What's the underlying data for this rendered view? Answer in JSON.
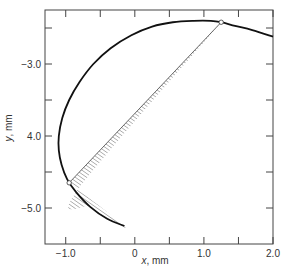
{
  "chart_data": {
    "type": "line",
    "title": "",
    "xlabel": "x, mm",
    "ylabel": "y, mm",
    "xlabel_var": "x",
    "xlabel_unit": ", mm",
    "ylabel_var": "y",
    "ylabel_unit": ", mm",
    "xlim": [
      -1.3,
      2.0
    ],
    "ylim": [
      -5.5,
      -2.25
    ],
    "grid": false,
    "x_ticks": [
      {
        "value": -1.0,
        "label": "−1.0"
      },
      {
        "value": -0.5,
        "label": ""
      },
      {
        "value": 0,
        "label": "0"
      },
      {
        "value": 0.5,
        "label": ""
      },
      {
        "value": 1.0,
        "label": "1.0"
      },
      {
        "value": 1.5,
        "label": ""
      },
      {
        "value": 2.0,
        "label": "2.0"
      }
    ],
    "y_ticks": [
      {
        "value": -2.5,
        "label": ""
      },
      {
        "value": -3.0,
        "label": "−3.0"
      },
      {
        "value": -3.5,
        "label": ""
      },
      {
        "value": -4.0,
        "label": "4.0"
      },
      {
        "value": -4.5,
        "label": ""
      },
      {
        "value": -5.0,
        "label": "−5.0"
      }
    ],
    "series": [
      {
        "name": "curve",
        "x": [
          -0.15,
          -0.4,
          -0.65,
          -0.85,
          -0.98,
          -1.06,
          -1.1,
          -1.1,
          -1.05,
          -0.95,
          -0.8,
          -0.6,
          -0.35,
          -0.05,
          0.25,
          0.55,
          0.85,
          1.1,
          1.25,
          1.45,
          1.7,
          2.0
        ],
        "y": [
          -5.25,
          -5.15,
          -4.98,
          -4.78,
          -4.6,
          -4.4,
          -4.2,
          -4.0,
          -3.75,
          -3.5,
          -3.25,
          -3.0,
          -2.78,
          -2.6,
          -2.48,
          -2.42,
          -2.4,
          -2.4,
          -2.42,
          -2.47,
          -2.53,
          -2.62
        ]
      }
    ],
    "shaded_region": {
      "label": "hatched area between curve and chord",
      "chord_start": {
        "x": -0.95,
        "y": -4.65
      },
      "chord_end": {
        "x": 1.25,
        "y": -2.42
      }
    },
    "markers": [
      {
        "x": -0.95,
        "y": -4.65,
        "style": "open-circle"
      },
      {
        "x": 1.25,
        "y": -2.42,
        "style": "open-circle"
      }
    ]
  }
}
